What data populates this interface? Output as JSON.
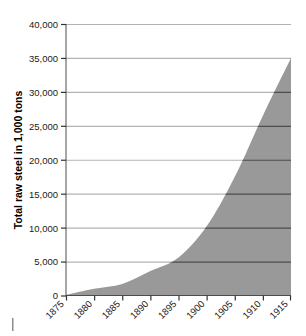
{
  "chart_data": {
    "type": "area",
    "title": "",
    "subtitle": "",
    "xlabel": "",
    "ylabel": "Total raw steel in 1,000 tons",
    "x": [
      1875,
      1880,
      1885,
      1890,
      1895,
      1900,
      1905,
      1910,
      1915
    ],
    "values": [
      100,
      1000,
      1700,
      3600,
      5600,
      10200,
      17500,
      26500,
      35000
    ],
    "series": [
      {
        "name": "Total raw steel",
        "values": [
          100,
          1000,
          1700,
          3600,
          5600,
          10200,
          17500,
          26500,
          35000
        ]
      }
    ],
    "xlim": [
      1875,
      1915
    ],
    "ylim": [
      0,
      40000
    ],
    "x_tick_labels": [
      "1875",
      "1880",
      "1885",
      "1890",
      "1895",
      "1900",
      "1905",
      "1910",
      "1915"
    ],
    "y_tick_labels": [
      "0",
      "5,000",
      "10,000",
      "15,000",
      "20,000",
      "25,000",
      "30,000",
      "35,000",
      "40,000"
    ],
    "y_tick_values": [
      0,
      5000,
      10000,
      15000,
      20000,
      25000,
      30000,
      35000,
      40000
    ],
    "grid": "horizontal",
    "legend": "none",
    "colors": {
      "area_fill": "#999999",
      "gridline": "#b3b3b3",
      "gridline_over_fill": "#4d4d4d",
      "axis": "#333333",
      "text": "#1a1a1a",
      "background": "#ffffff"
    },
    "x_tick_label_rotation": -45
  }
}
